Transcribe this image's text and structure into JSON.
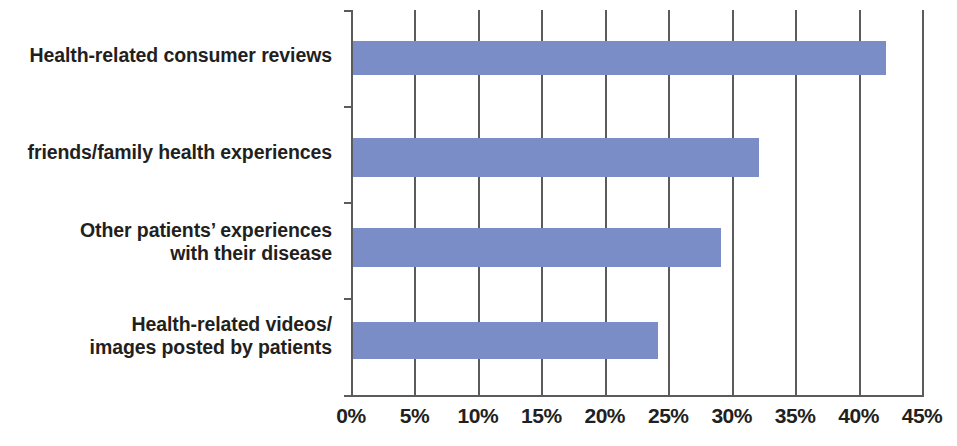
{
  "chart_data": {
    "type": "bar",
    "orientation": "horizontal",
    "title": "",
    "subtitle": "",
    "xlabel": "",
    "ylabel": "",
    "categories": [
      "Health-related consumer reviews",
      "friends/family health experiences",
      "Other patients’ experiences\nwith their disease",
      "Health-related videos/\nimages posted by patients"
    ],
    "values": [
      42,
      32,
      29,
      24
    ],
    "value_suffix": "%",
    "xlim": [
      0,
      45
    ],
    "xticks": [
      0,
      5,
      10,
      15,
      20,
      25,
      30,
      35,
      40,
      45
    ],
    "xtick_labels": [
      "0%",
      "5%",
      "10%",
      "15%",
      "20%",
      "25%",
      "30%",
      "35%",
      "40%",
      "45%"
    ],
    "grid": true,
    "grid_axis": "x",
    "legend": null,
    "legend_position": "none",
    "bar_color": "#7b8dc7",
    "axis_color": "#5b5b5b",
    "text_color": "#231f20",
    "background_color": "#ffffff",
    "annotations": []
  }
}
